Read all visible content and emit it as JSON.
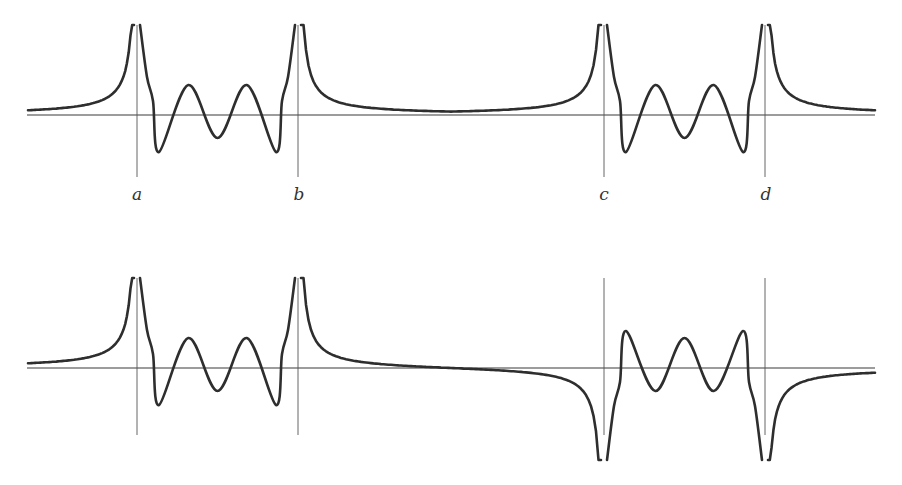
{
  "figure": {
    "labels": {
      "a": "a",
      "b": "b",
      "c": "c",
      "d": "d"
    }
  },
  "chart_data": [
    {
      "type": "line",
      "title": "",
      "panel": "top",
      "markers": [
        {
          "label": "a",
          "x": 137
        },
        {
          "label": "b",
          "x": 298
        },
        {
          "label": "c",
          "x": 604
        },
        {
          "label": "d",
          "x": 765
        }
      ],
      "axis_y": 115,
      "vline_range": [
        25,
        177
      ],
      "label_y": 195,
      "segments": [
        {
          "region": "left of a",
          "behavior": "rises from baseline to +infinity at a"
        },
        {
          "region": "a to b",
          "behavior": "drops from +inf, oscillates: min, max, min, max, min (two peaks above axis, three troughs below), rises to +inf at b",
          "extrema": [
            "min -37",
            "max +30",
            "min -23",
            "max +30",
            "min -37"
          ]
        },
        {
          "region": "b to c",
          "behavior": "decays from +inf to small positive plateau then rises to +inf at c"
        },
        {
          "region": "c to d",
          "behavior": "same oscillation pattern as a to b"
        },
        {
          "region": "right of d",
          "behavior": "decays from +inf toward axis"
        }
      ]
    },
    {
      "type": "line",
      "title": "",
      "panel": "bottom",
      "markers": [
        {
          "label": "a",
          "x": 137
        },
        {
          "label": "b",
          "x": 298
        },
        {
          "label": "c",
          "x": 604
        },
        {
          "label": "d",
          "x": 765
        }
      ],
      "axis_y": 368,
      "vline_range": [
        278,
        435
      ],
      "segments": [
        {
          "region": "left of a",
          "behavior": "rises from baseline to +infinity at a"
        },
        {
          "region": "a to b",
          "behavior": "same as top panel: troughs below axis, two peaks above",
          "extrema": [
            "min -37",
            "max +30",
            "min -23",
            "max +30",
            "min -37"
          ]
        },
        {
          "region": "b to c",
          "behavior": "decays from +inf, crosses axis near middle, falls to -inf at c"
        },
        {
          "region": "c to d",
          "behavior": "mirrored oscillation: three peaks above axis, two troughs below",
          "extrema": [
            "max +37",
            "min -23",
            "max +30",
            "min -23",
            "max +37"
          ]
        },
        {
          "region": "right of d",
          "behavior": "rises from -inf toward axis from below"
        }
      ]
    }
  ]
}
